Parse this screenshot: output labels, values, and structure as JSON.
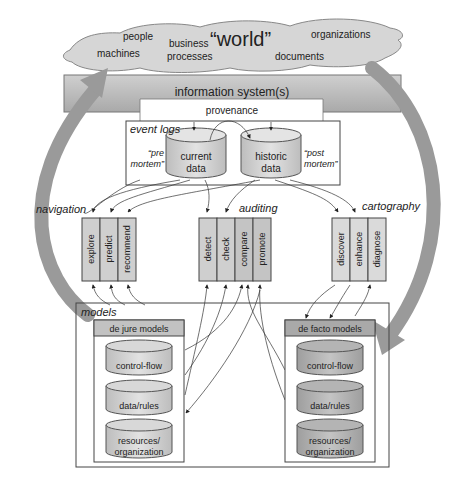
{
  "world": {
    "title": "“world”",
    "items": [
      "people",
      "machines",
      "business",
      "processes",
      "organizations",
      "documents"
    ]
  },
  "information_system": {
    "label": "information system(s)",
    "provenance": "provenance"
  },
  "event_logs": {
    "label": "event logs",
    "current": {
      "line1": "current",
      "line2": "data",
      "note1": "“pre",
      "note2": "mortem”"
    },
    "historic": {
      "line1": "historic",
      "line2": "data",
      "note1": "“post",
      "note2": "mortem”"
    }
  },
  "groups": {
    "navigation": {
      "label": "navigation",
      "items": [
        "explore",
        "predict",
        "recommend"
      ]
    },
    "auditing": {
      "label": "auditing",
      "items": [
        "detect",
        "check",
        "compare",
        "promote"
      ]
    },
    "cartography": {
      "label": "cartography",
      "items": [
        "discover",
        "enhance",
        "diagnose"
      ]
    }
  },
  "models": {
    "label": "models",
    "de_jure": {
      "title": "de jure models",
      "items": [
        "control-flow",
        "data/rules",
        "resources/",
        "organization"
      ]
    },
    "de_facto": {
      "title": "de facto models",
      "items": [
        "control-flow",
        "data/rules",
        "resources/",
        "organization"
      ]
    }
  },
  "colors": {
    "cloud": "#d6d6d6",
    "is_bar": "#bdbdbd",
    "box_fill": "#cfcfcf",
    "big_arrow": "#9a9a9a",
    "line": "#333333"
  }
}
